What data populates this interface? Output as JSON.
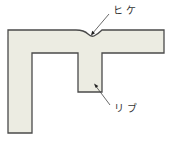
{
  "diagram": {
    "labels": {
      "sink_mark": "ヒケ",
      "rib": "リブ"
    },
    "colors": {
      "fill": "#ecece2",
      "stroke": "#4a4a4a",
      "leader": "#444444"
    }
  }
}
